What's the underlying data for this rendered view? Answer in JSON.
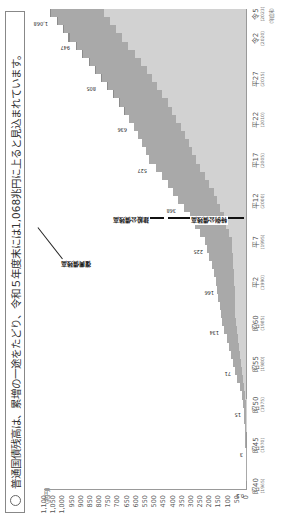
{
  "title": "普通国債残高は、累増の一途をたどり、令和５年度末には1,068兆円に上ると見込まれています。",
  "chart_data": {
    "type": "bar",
    "ylabel": "(兆円)",
    "xlabel": "(年度末)",
    "ylim": [
      0,
      1100
    ],
    "yticks": [
      "0",
      "50",
      "100",
      "150",
      "200",
      "250",
      "300",
      "350",
      "400",
      "450",
      "500",
      "550",
      "600",
      "650",
      "700",
      "750",
      "800",
      "850",
      "900",
      "950",
      "1,000",
      "1,050",
      "1,100"
    ],
    "categories": [
      "昭40",
      "昭45",
      "昭50",
      "昭55",
      "昭60",
      "平2",
      "平7",
      "平12",
      "平17",
      "平22",
      "平27",
      "令2",
      "令5"
    ],
    "category_years": [
      "(1965)",
      "(1970)",
      "(1975)",
      "(1980)",
      "(1985)",
      "(1990)",
      "(1995)",
      "(2000)",
      "(2005)",
      "(2010)",
      "(2015)",
      "(2020)",
      "(2023)"
    ],
    "series": [
      {
        "name": "特例公債残高",
        "values": [
          0,
          0,
          2,
          28,
          56,
          64,
          78,
          156,
          275,
          379,
          512,
          678,
          776
        ]
      },
      {
        "name": "建設公債残高",
        "values": [
          0.2,
          3,
          13,
          43,
          75,
          102,
          147,
          212,
          252,
          257,
          273,
          283,
          290
        ]
      },
      {
        "name": "復興債残高",
        "values": [
          0,
          0,
          0,
          0,
          0,
          0,
          0,
          0,
          0,
          0,
          5,
          6,
          2
        ]
      }
    ],
    "totals": [
      0.2,
      3,
      15,
      71,
      134,
      166,
      225,
      368,
      527,
      636,
      805,
      947,
      1068
    ],
    "labels_top_region": [
      "991",
      "1,043",
      "1,068",
      "1,041",
      "887"
    ],
    "annotations": [
      "建設公債残高",
      "特例公債残高",
      "復興債残高"
    ],
    "grid": false,
    "legend": "inline annotations"
  }
}
